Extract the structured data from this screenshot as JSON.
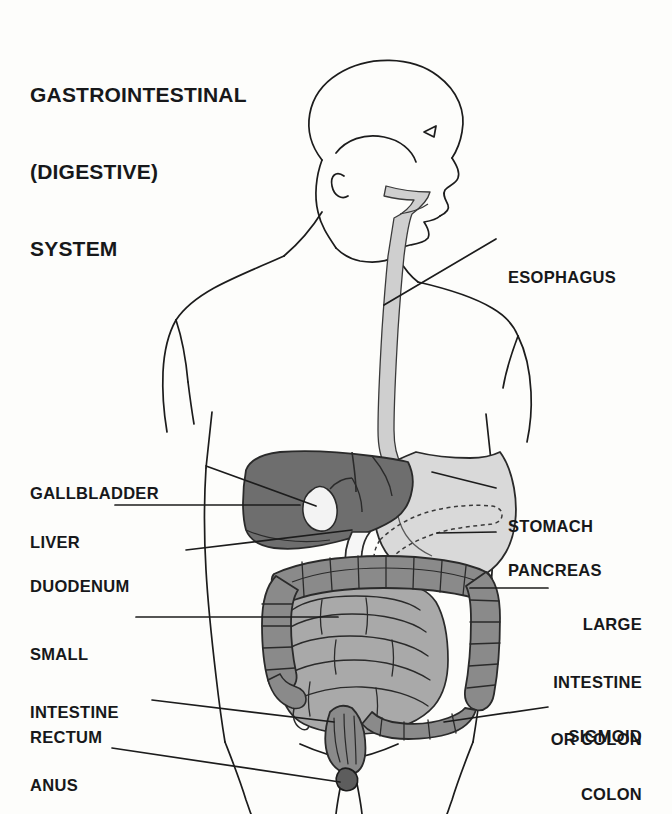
{
  "title": {
    "line1": "GASTROINTESTINAL",
    "line2": "(DIGESTIVE)",
    "line3": "SYSTEM",
    "full": "GASTROINTESTINAL (DIGESTIVE) SYSTEM"
  },
  "colors": {
    "background": "#fdfdfb",
    "outline": "#1c1c1c",
    "liver": "#6e6e6e",
    "stomach": "#d9d9d9",
    "esophagus": "#cfcfcf",
    "large_intestine": "#8a8a8a",
    "small_intestine": "#a9a9a9",
    "rectum": "#8a8a8a",
    "anus": "#6e6e6e",
    "gallbladder": "#f3f3f3",
    "duodenum": "#f6f6f6",
    "pancreas_dashed": "#4a4a4a",
    "text": "#17181a"
  },
  "labels": {
    "left": [
      {
        "id": "gallbladder",
        "text": "GALLBLADDER",
        "lines": [
          "GALLBLADDER"
        ]
      },
      {
        "id": "liver",
        "text": "LIVER",
        "lines": [
          "LIVER"
        ]
      },
      {
        "id": "duodenum",
        "text": "DUODENUM",
        "lines": [
          "DUODENUM"
        ]
      },
      {
        "id": "small-intestine",
        "text": "SMALL INTESTINE",
        "lines": [
          "SMALL",
          "INTESTINE"
        ]
      },
      {
        "id": "rectum",
        "text": "RECTUM",
        "lines": [
          "RECTUM"
        ]
      },
      {
        "id": "anus",
        "text": "ANUS",
        "lines": [
          "ANUS"
        ]
      }
    ],
    "right": [
      {
        "id": "esophagus",
        "text": "ESOPHAGUS",
        "lines": [
          "ESOPHAGUS"
        ]
      },
      {
        "id": "stomach",
        "text": "STOMACH",
        "lines": [
          "STOMACH"
        ]
      },
      {
        "id": "pancreas",
        "text": "PANCREAS",
        "lines": [
          "PANCREAS"
        ]
      },
      {
        "id": "large-intestine",
        "text": "LARGE INTESTINE OR COLON",
        "lines": [
          "LARGE",
          "INTESTINE",
          "OR COLON"
        ]
      },
      {
        "id": "sigmoid-colon",
        "text": "SIGMOID COLON",
        "lines": [
          "SIGMOID",
          "COLON"
        ]
      }
    ]
  },
  "label_text": {
    "gallbladder": "GALLBLADDER",
    "liver": "LIVER",
    "duodenum": "DUODENUM",
    "small_intestine_1": "SMALL",
    "small_intestine_2": "INTESTINE",
    "rectum": "RECTUM",
    "anus": "ANUS",
    "esophagus": "ESOPHAGUS",
    "stomach": "STOMACH",
    "pancreas": "PANCREAS",
    "large_intestine_1": "LARGE",
    "large_intestine_2": "INTESTINE",
    "large_intestine_3": "OR COLON",
    "sigmoid_1": "SIGMOID",
    "sigmoid_2": "COLON"
  },
  "figure": {
    "view": "anterior human torso with head in profile facing right",
    "organs_depicted": [
      "mouth",
      "pharynx",
      "esophagus",
      "stomach",
      "liver",
      "gallbladder",
      "pancreas",
      "duodenum",
      "small intestine",
      "large intestine",
      "sigmoid colon",
      "rectum",
      "anus"
    ]
  }
}
